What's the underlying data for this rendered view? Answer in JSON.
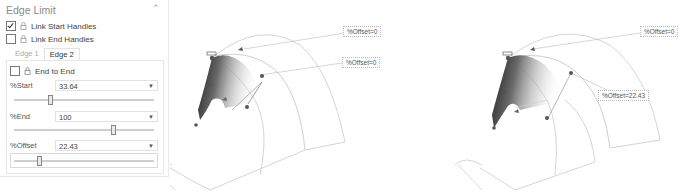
{
  "panel": {
    "title": "Edge Limit",
    "collapse_icon": "chevron-up-icon",
    "link_start_handles": {
      "label": "Link Start Handles",
      "checked": true
    },
    "link_end_handles": {
      "label": "Link End Handles",
      "checked": false
    },
    "tabs": [
      {
        "label": "Edge 1",
        "active": false
      },
      {
        "label": "Edge 2",
        "active": true
      }
    ],
    "end_to_end": {
      "label": "End to End",
      "checked": false
    },
    "fields": {
      "start": {
        "label": "%Start",
        "value": "33.64",
        "slider_percent": 33.64
      },
      "end": {
        "label": "%End",
        "value": "100",
        "slider_percent": 100
      },
      "offset": {
        "label": "%Offset",
        "value": "22.43",
        "slider_percent": 22.43
      }
    }
  },
  "viewports": {
    "before": {
      "label_top": "%Offset=0",
      "label_mid": "%Offset=0"
    },
    "after": {
      "label_top": "%Offset=0",
      "label_mid": "%Offset=22.43"
    }
  }
}
